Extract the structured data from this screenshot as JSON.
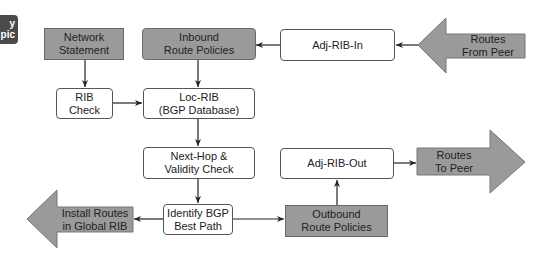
{
  "badge": {
    "line1": "y",
    "line2": "pic"
  },
  "colors": {
    "process_fill": "#ffffff",
    "policy_fill": "#9a9a9a",
    "arrow_fill": "#9a9a9a",
    "stroke": "#333333",
    "badge": "#4a4a4a"
  },
  "nodes": {
    "network_statement": {
      "line1": "Network",
      "line2": "Statement"
    },
    "inbound_policies": {
      "line1": "Inbound",
      "line2": "Route Policies"
    },
    "adj_rib_in": {
      "line1": "Adj-RIB-In"
    },
    "routes_from_peer": {
      "line1": "Routes",
      "line2": "From Peer"
    },
    "rib_check": {
      "line1": "RIB",
      "line2": "Check"
    },
    "loc_rib": {
      "line1": "Loc-RIB",
      "line2": "(BGP Database)"
    },
    "next_hop": {
      "line1": "Next-Hop &",
      "line2": "Validity Check"
    },
    "adj_rib_out": {
      "line1": "Adj-RIB-Out"
    },
    "routes_to_peer": {
      "line1": "Routes",
      "line2": "To Peer"
    },
    "best_path": {
      "line1": "Identify BGP",
      "line2": "Best Path"
    },
    "outbound_policies": {
      "line1": "Outbound",
      "line2": "Route Policies"
    },
    "install_routes": {
      "line1": "Install Routes",
      "line2": "in Global RIB"
    }
  },
  "edges": [
    [
      "routes_from_peer",
      "adj_rib_in"
    ],
    [
      "adj_rib_in",
      "inbound_policies"
    ],
    [
      "network_statement",
      "rib_check"
    ],
    [
      "inbound_policies",
      "loc_rib"
    ],
    [
      "rib_check",
      "loc_rib"
    ],
    [
      "loc_rib",
      "next_hop"
    ],
    [
      "next_hop",
      "best_path"
    ],
    [
      "best_path",
      "install_routes"
    ],
    [
      "best_path",
      "outbound_policies"
    ],
    [
      "outbound_policies",
      "adj_rib_out"
    ],
    [
      "adj_rib_out",
      "routes_to_peer"
    ]
  ]
}
